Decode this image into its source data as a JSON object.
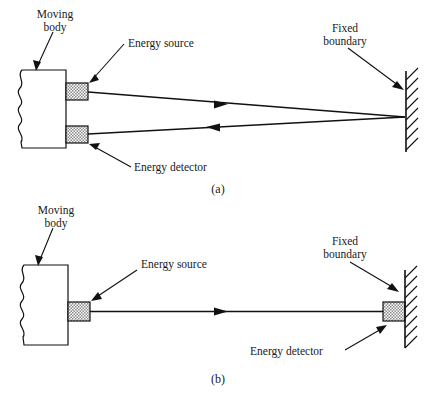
{
  "figure": {
    "title": "",
    "background_color": "#ffffff",
    "line_color": "#111111",
    "hatch_fill_color": "#b8b8b8",
    "panels": [
      {
        "id": "a",
        "caption": "(a)",
        "labels": {
          "moving_body": {
            "line1": "Moving",
            "line2": "body"
          },
          "energy_source": "Energy source",
          "energy_detector": "Energy detector",
          "fixed_boundary": {
            "line1": "Fixed",
            "line2": "boundary"
          }
        },
        "beams": [
          {
            "name": "outgoing-beam",
            "direction": "right",
            "arrow": "▶"
          },
          {
            "name": "returning-beam",
            "direction": "left",
            "arrow": "◀"
          }
        ]
      },
      {
        "id": "b",
        "caption": "(b)",
        "labels": {
          "moving_body": {
            "line1": "Moving",
            "line2": "body"
          },
          "energy_source": "Energy source",
          "energy_detector": "Energy detector",
          "fixed_boundary": {
            "line1": "Fixed",
            "line2": "boundary"
          }
        },
        "beams": [
          {
            "name": "through-beam",
            "direction": "right",
            "arrow": "▶"
          }
        ]
      }
    ]
  }
}
